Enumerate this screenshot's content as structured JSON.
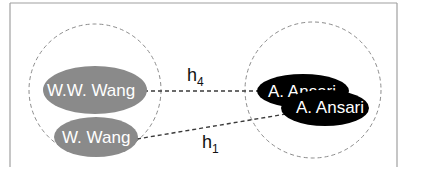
{
  "diagram": {
    "type": "entity-resolution-hypothesis",
    "colors": {
      "frame": "#9a9a9a",
      "cluster_outline": "#8c8c8c",
      "edge": "#3a3a3a",
      "left_node_fill": "#8a8a8a",
      "right_node_fill": "#000000",
      "node_text": "#ffffff"
    },
    "clusters": [
      {
        "id": "left-cluster",
        "nodes": [
          {
            "id": "ww-wang",
            "label": "W.W. Wang"
          },
          {
            "id": "w-wang",
            "label": "W. Wang"
          }
        ]
      },
      {
        "id": "right-cluster",
        "nodes": [
          {
            "id": "a-ansari-1",
            "label": "A. Ansari"
          },
          {
            "id": "a-ansari-2",
            "label": "A. Ansari"
          }
        ]
      }
    ],
    "edges": [
      {
        "id": "h4",
        "from": "ww-wang",
        "to": "a-ansari-1",
        "label_main": "h",
        "label_sub": "4"
      },
      {
        "id": "h1",
        "from": "w-wang",
        "to": "a-ansari-2",
        "label_main": "h",
        "label_sub": "1"
      }
    ]
  }
}
